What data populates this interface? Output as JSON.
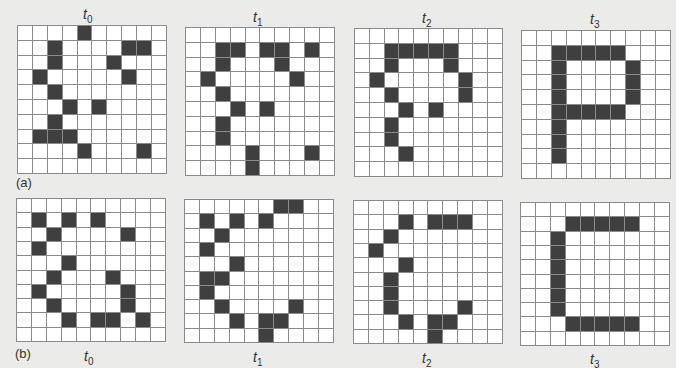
{
  "colors": {
    "background": "#ebebea",
    "cell_on": "#3f3f3f",
    "cell_off": "#ffffff",
    "grid_line": "#8a8a8a"
  },
  "grid_size": 10,
  "rows": [
    {
      "label": "(a)",
      "panels": [
        {
          "time": "t",
          "sub": "0",
          "on": [
            [
              0,
              4
            ],
            [
              1,
              2
            ],
            [
              1,
              7
            ],
            [
              1,
              8
            ],
            [
              2,
              2
            ],
            [
              2,
              6
            ],
            [
              3,
              1
            ],
            [
              3,
              7
            ],
            [
              4,
              2
            ],
            [
              5,
              3
            ],
            [
              5,
              5
            ],
            [
              6,
              2
            ],
            [
              7,
              1
            ],
            [
              7,
              2
            ],
            [
              7,
              3
            ],
            [
              8,
              4
            ],
            [
              8,
              8
            ]
          ]
        },
        {
          "time": "t",
          "sub": "1",
          "on": [
            [
              1,
              2
            ],
            [
              1,
              3
            ],
            [
              1,
              5
            ],
            [
              1,
              6
            ],
            [
              1,
              8
            ],
            [
              2,
              2
            ],
            [
              2,
              6
            ],
            [
              3,
              1
            ],
            [
              3,
              7
            ],
            [
              4,
              2
            ],
            [
              5,
              3
            ],
            [
              5,
              5
            ],
            [
              6,
              2
            ],
            [
              7,
              2
            ],
            [
              8,
              4
            ],
            [
              8,
              8
            ],
            [
              9,
              4
            ]
          ]
        },
        {
          "time": "t",
          "sub": "2",
          "on": [
            [
              1,
              2
            ],
            [
              1,
              3
            ],
            [
              1,
              4
            ],
            [
              1,
              5
            ],
            [
              1,
              6
            ],
            [
              2,
              2
            ],
            [
              2,
              6
            ],
            [
              3,
              1
            ],
            [
              3,
              7
            ],
            [
              4,
              2
            ],
            [
              4,
              7
            ],
            [
              5,
              3
            ],
            [
              5,
              5
            ],
            [
              6,
              2
            ],
            [
              7,
              2
            ],
            [
              8,
              3
            ]
          ]
        },
        {
          "time": "t",
          "sub": "3",
          "on": [
            [
              1,
              2
            ],
            [
              1,
              3
            ],
            [
              1,
              4
            ],
            [
              1,
              5
            ],
            [
              1,
              6
            ],
            [
              2,
              2
            ],
            [
              2,
              7
            ],
            [
              3,
              2
            ],
            [
              3,
              7
            ],
            [
              4,
              2
            ],
            [
              4,
              7
            ],
            [
              5,
              2
            ],
            [
              5,
              3
            ],
            [
              5,
              4
            ],
            [
              5,
              5
            ],
            [
              5,
              6
            ],
            [
              6,
              2
            ],
            [
              7,
              2
            ],
            [
              8,
              2
            ]
          ]
        }
      ]
    },
    {
      "label": "(b)",
      "panels": [
        {
          "time": "t",
          "sub": "0",
          "on": [
            [
              1,
              1
            ],
            [
              1,
              3
            ],
            [
              1,
              5
            ],
            [
              2,
              2
            ],
            [
              2,
              7
            ],
            [
              3,
              1
            ],
            [
              4,
              3
            ],
            [
              5,
              2
            ],
            [
              5,
              6
            ],
            [
              6,
              1
            ],
            [
              6,
              7
            ],
            [
              7,
              2
            ],
            [
              7,
              7
            ],
            [
              8,
              3
            ],
            [
              8,
              5
            ],
            [
              8,
              6
            ],
            [
              8,
              8
            ]
          ]
        },
        {
          "time": "t",
          "sub": "1",
          "on": [
            [
              0,
              6
            ],
            [
              0,
              7
            ],
            [
              1,
              1
            ],
            [
              1,
              3
            ],
            [
              1,
              5
            ],
            [
              2,
              2
            ],
            [
              3,
              1
            ],
            [
              4,
              3
            ],
            [
              5,
              1
            ],
            [
              5,
              2
            ],
            [
              6,
              1
            ],
            [
              7,
              2
            ],
            [
              7,
              7
            ],
            [
              8,
              3
            ],
            [
              8,
              5
            ],
            [
              8,
              6
            ],
            [
              9,
              5
            ]
          ]
        },
        {
          "time": "t",
          "sub": "2",
          "on": [
            [
              1,
              3
            ],
            [
              1,
              5
            ],
            [
              1,
              6
            ],
            [
              1,
              7
            ],
            [
              2,
              2
            ],
            [
              3,
              1
            ],
            [
              4,
              3
            ],
            [
              5,
              2
            ],
            [
              6,
              2
            ],
            [
              7,
              2
            ],
            [
              7,
              7
            ],
            [
              8,
              3
            ],
            [
              8,
              5
            ],
            [
              8,
              6
            ],
            [
              9,
              5
            ]
          ]
        },
        {
          "time": "t",
          "sub": "3",
          "on": [
            [
              1,
              3
            ],
            [
              1,
              4
            ],
            [
              1,
              5
            ],
            [
              1,
              6
            ],
            [
              1,
              7
            ],
            [
              2,
              2
            ],
            [
              3,
              2
            ],
            [
              4,
              2
            ],
            [
              5,
              2
            ],
            [
              6,
              2
            ],
            [
              7,
              2
            ],
            [
              8,
              3
            ],
            [
              8,
              4
            ],
            [
              8,
              5
            ],
            [
              8,
              6
            ],
            [
              8,
              7
            ]
          ]
        }
      ]
    }
  ]
}
